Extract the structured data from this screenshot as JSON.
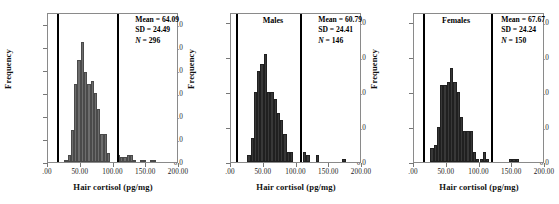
{
  "figure": {
    "panel_count": 3,
    "background": "#ffffff"
  },
  "chart_data": [
    {
      "type": "bar",
      "title": "",
      "xlabel": "Hair cortisol (pg/mg)",
      "ylabel": "Frequency",
      "xlim": [
        0,
        200
      ],
      "ylim": [
        0,
        65
      ],
      "grid": false,
      "legend": "none",
      "bar_color": "#6d6d6d",
      "xticks": [
        ".00",
        "50.00",
        "100.00",
        "150.00",
        "200.00"
      ],
      "xtick_values": [
        0,
        50,
        100,
        150,
        200
      ],
      "yticks": [
        "0.0",
        "10.0",
        "20.0",
        "30.0",
        "40.0",
        "50.0",
        "60.0"
      ],
      "ytick_values": [
        0,
        10,
        20,
        30,
        40,
        50,
        60
      ],
      "vlines": [
        15,
        107
      ],
      "bin_width": 5,
      "x": [
        25,
        30,
        35,
        40,
        45,
        50,
        55,
        60,
        65,
        70,
        75,
        80,
        85,
        90,
        95,
        100,
        105,
        110,
        115,
        120,
        125,
        130,
        135,
        140,
        145,
        150,
        155,
        160,
        165,
        170,
        175
      ],
      "values": [
        1,
        3,
        14,
        34,
        44,
        52,
        39,
        34,
        35,
        30,
        23,
        12,
        12,
        4,
        0,
        0,
        3,
        2,
        2,
        3,
        3,
        1,
        0,
        1,
        1,
        0,
        1,
        1,
        0,
        0,
        0
      ],
      "annotations": {
        "mean_label": "Mean = 64.09",
        "sd_label": "SD = 24.49",
        "n_label": "N = 296",
        "n_symbol": "N",
        "n_value": " = 296"
      }
    },
    {
      "type": "bar",
      "title": "Males",
      "xlabel": "Hair cortisol (pg/mg)",
      "ylabel": "Frequency",
      "xlim": [
        0,
        200
      ],
      "ylim": [
        0,
        43
      ],
      "grid": false,
      "legend": "none",
      "bar_color": "#383838",
      "xticks": [
        ".00",
        "50.00",
        "100.00",
        "150.00",
        "200.00"
      ],
      "xtick_values": [
        0,
        50,
        100,
        150,
        200
      ],
      "yticks": [
        "0.0",
        "10.0",
        "20.0",
        "30.0",
        "40.0"
      ],
      "ytick_values": [
        0,
        10,
        20,
        30,
        40
      ],
      "vlines": [
        9,
        107
      ],
      "bin_width": 5,
      "x": [
        25,
        30,
        35,
        40,
        45,
        50,
        55,
        60,
        65,
        70,
        75,
        80,
        85,
        90,
        95,
        100,
        105,
        110,
        115,
        120,
        125,
        130,
        135,
        140,
        145,
        150,
        155,
        160,
        165,
        170
      ],
      "values": [
        2,
        7,
        20,
        26,
        28,
        31,
        20,
        20,
        18,
        14,
        12,
        8,
        3,
        3,
        0,
        0,
        0,
        3,
        2,
        0,
        0,
        2,
        0,
        0,
        0,
        0,
        0,
        0,
        0,
        1
      ],
      "annotations": {
        "mean_label": "Mean = 60.79",
        "sd_label": "SD = 24.41",
        "n_label": "N = 146",
        "n_symbol": "N",
        "n_value": " = 146"
      }
    },
    {
      "type": "bar",
      "title": "Females",
      "xlabel": "Hair cortisol (pg/mg)",
      "ylabel": "Frequency",
      "xlim": [
        0,
        200
      ],
      "ylim": [
        0,
        43
      ],
      "grid": false,
      "legend": "none",
      "bar_color": "#383838",
      "xticks": [
        ".00",
        "50.00",
        "100.00",
        "150.00",
        "200.00"
      ],
      "xtick_values": [
        0,
        50,
        100,
        150,
        200
      ],
      "yticks": [
        "0.0",
        "10.0",
        "20.0",
        "30.0",
        "40.0"
      ],
      "ytick_values": [
        0,
        10,
        20,
        30,
        40
      ],
      "vlines": [
        15,
        119
      ],
      "bin_width": 5,
      "x": [
        25,
        30,
        35,
        40,
        45,
        50,
        55,
        60,
        65,
        70,
        75,
        80,
        85,
        90,
        95,
        100,
        105,
        110,
        115,
        120,
        125,
        130,
        135,
        140,
        145,
        150,
        155,
        160,
        165,
        170
      ],
      "values": [
        4,
        5,
        10,
        22,
        22,
        23,
        27,
        23,
        20,
        13,
        9,
        9,
        9,
        3,
        1,
        1,
        3,
        1,
        0,
        0,
        0,
        0,
        0,
        0,
        1,
        1,
        1,
        0,
        0,
        0
      ],
      "annotations": {
        "mean_label": "Mean = 67.67",
        "sd_label": "SD = 24.24",
        "n_label": "N = 150",
        "n_symbol": "N",
        "n_value": " = 150"
      }
    }
  ]
}
